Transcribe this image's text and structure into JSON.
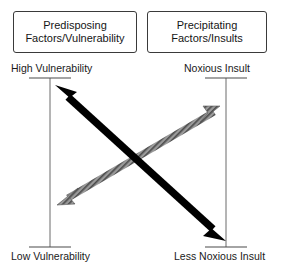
{
  "diagram": {
    "title_boxes": [
      {
        "name": "predisposing",
        "line1": "Predisposing",
        "line2": "Factors/Vulnerability"
      },
      {
        "name": "precipitating",
        "line1": "Precipitating",
        "line2": "Factors/Insults"
      }
    ],
    "axes": [
      {
        "name": "vulnerability-axis",
        "top_label": "High Vulnerability",
        "bottom_label": "Low Vulnerability"
      },
      {
        "name": "insult-axis",
        "top_label": "Noxious Insult",
        "bottom_label": "Less Noxious Insult"
      }
    ],
    "arrows": [
      {
        "name": "vulnerability-arrow",
        "style": "solid-black",
        "color": "#000000",
        "double_headed": true,
        "from": "high-vulnerability-top-left",
        "to": "less-noxious-insult-bottom-right"
      },
      {
        "name": "insult-arrow",
        "style": "hatched-gray",
        "color": "#888888",
        "double_headed": true,
        "from": "low-vulnerability-bottom-left",
        "to": "noxious-insult-top-right"
      }
    ],
    "colors": {
      "box_border": "#3a3a3a",
      "axis_line": "#5a5a5a",
      "text": "#151515",
      "black_arrow": "#000000",
      "gray_arrow": "#8a8a8a",
      "background": "#ffffff"
    }
  }
}
